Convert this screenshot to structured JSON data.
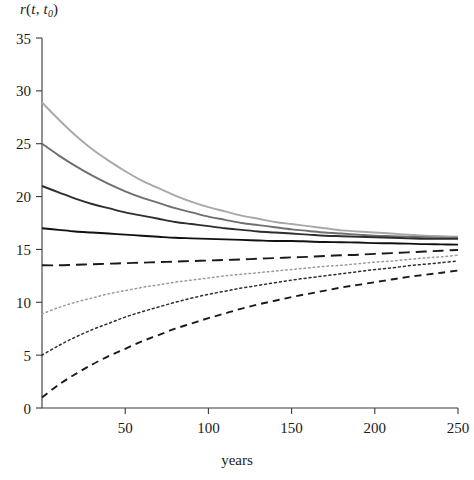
{
  "chart_data": {
    "type": "line",
    "title": "",
    "ylabel": "r(t, t_0)",
    "ylabel_parts": {
      "fn": "r",
      "open": "(",
      "arg1": "t",
      "comma": ", ",
      "arg2": "t",
      "sub": "0",
      "close": ")"
    },
    "xlabel": "years",
    "xlim": [
      0,
      250
    ],
    "ylim": [
      0,
      35
    ],
    "xticks": [
      50,
      100,
      150,
      200,
      250
    ],
    "xtick_labels": [
      "50",
      "100",
      "150",
      "200",
      "250"
    ],
    "yticks": [
      0,
      5,
      10,
      15,
      20,
      25,
      30,
      35
    ],
    "ytick_labels": [
      "0",
      "5",
      "10",
      "15",
      "20",
      "25",
      "30",
      "35"
    ],
    "grid": false,
    "legend": "none",
    "x": [
      0,
      10,
      20,
      30,
      40,
      50,
      60,
      70,
      80,
      90,
      100,
      110,
      120,
      130,
      140,
      150,
      160,
      170,
      180,
      190,
      200,
      210,
      220,
      230,
      240,
      250
    ],
    "series": [
      {
        "name": "r0 = 29",
        "style": "solid",
        "color": "#a8a8a8",
        "width": 1.9,
        "values": [
          28.9,
          27.3,
          25.8,
          24.5,
          23.4,
          22.4,
          21.5,
          20.8,
          20.1,
          19.5,
          19.0,
          18.6,
          18.2,
          17.9,
          17.6,
          17.4,
          17.2,
          17.0,
          16.8,
          16.7,
          16.6,
          16.5,
          16.4,
          16.3,
          16.25,
          16.2
        ]
      },
      {
        "name": "r0 = 25",
        "style": "solid",
        "color": "#6f6f6f",
        "width": 1.9,
        "values": [
          25.0,
          23.9,
          22.9,
          22.0,
          21.2,
          20.5,
          19.9,
          19.4,
          18.9,
          18.5,
          18.1,
          17.8,
          17.5,
          17.3,
          17.1,
          16.9,
          16.75,
          16.6,
          16.5,
          16.4,
          16.3,
          16.25,
          16.2,
          16.15,
          16.1,
          16.1
        ]
      },
      {
        "name": "r0 = 21",
        "style": "solid",
        "color": "#2e2e2e",
        "width": 1.9,
        "values": [
          21.0,
          20.4,
          19.8,
          19.3,
          18.9,
          18.5,
          18.2,
          17.9,
          17.6,
          17.4,
          17.2,
          17.0,
          16.85,
          16.7,
          16.6,
          16.5,
          16.4,
          16.3,
          16.25,
          16.2,
          16.15,
          16.1,
          16.05,
          16.0,
          16.0,
          16.0
        ]
      },
      {
        "name": "r0 = 17",
        "style": "solid",
        "color": "#111111",
        "width": 1.9,
        "values": [
          17.0,
          16.85,
          16.7,
          16.6,
          16.5,
          16.4,
          16.3,
          16.2,
          16.1,
          16.05,
          16.0,
          15.95,
          15.9,
          15.85,
          15.8,
          15.8,
          15.75,
          15.7,
          15.68,
          15.65,
          15.6,
          15.58,
          15.55,
          15.5,
          15.48,
          15.45
        ]
      },
      {
        "name": "r0 = 13.5",
        "style": "dashed-long",
        "color": "#1a1a1a",
        "width": 1.9,
        "values": [
          13.5,
          13.5,
          13.55,
          13.6,
          13.65,
          13.7,
          13.75,
          13.8,
          13.85,
          13.9,
          13.95,
          14.0,
          14.05,
          14.12,
          14.18,
          14.25,
          14.3,
          14.38,
          14.45,
          14.5,
          14.58,
          14.65,
          14.72,
          14.8,
          14.88,
          14.95
        ]
      },
      {
        "name": "r0 = 9",
        "style": "dotted-light",
        "color": "#9a9a9a",
        "width": 1.5,
        "values": [
          8.9,
          9.5,
          10.0,
          10.4,
          10.8,
          11.1,
          11.4,
          11.65,
          11.9,
          12.1,
          12.3,
          12.5,
          12.65,
          12.8,
          12.95,
          13.1,
          13.25,
          13.4,
          13.5,
          13.65,
          13.8,
          13.9,
          14.05,
          14.2,
          14.3,
          14.45
        ]
      },
      {
        "name": "r0 = 5",
        "style": "dotted",
        "color": "#2e2e2e",
        "width": 1.5,
        "values": [
          5.0,
          5.9,
          6.7,
          7.4,
          8.0,
          8.6,
          9.1,
          9.55,
          10.0,
          10.4,
          10.75,
          11.05,
          11.35,
          11.6,
          11.85,
          12.1,
          12.3,
          12.5,
          12.7,
          12.9,
          13.1,
          13.25,
          13.45,
          13.6,
          13.75,
          13.9
        ]
      },
      {
        "name": "r0 = 1",
        "style": "dashed",
        "color": "#1a1a1a",
        "width": 1.9,
        "values": [
          1.0,
          2.2,
          3.2,
          4.1,
          4.9,
          5.6,
          6.3,
          6.9,
          7.5,
          8.0,
          8.5,
          8.95,
          9.4,
          9.8,
          10.15,
          10.5,
          10.8,
          11.1,
          11.4,
          11.65,
          11.9,
          12.15,
          12.4,
          12.6,
          12.8,
          13.0
        ]
      }
    ]
  },
  "plot_geometry": {
    "left": 42,
    "right": 458,
    "top": 38,
    "bottom": 408
  }
}
